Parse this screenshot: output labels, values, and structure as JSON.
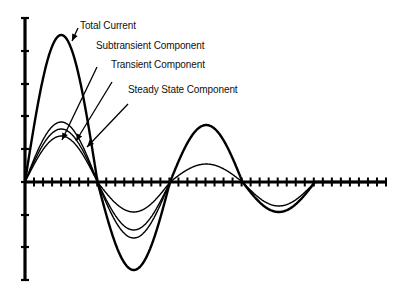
{
  "chart_data": {
    "type": "line",
    "title": "",
    "xlabel": "",
    "ylabel": "",
    "grid": false,
    "legend_position": "annotations with arrows",
    "x_axis": {
      "y_px": 182,
      "x_start_px": 25,
      "x_end_px": 386,
      "tick_count": 40
    },
    "y_axis": {
      "x_px": 25,
      "y_top_px": 18,
      "y_bottom_px": 280,
      "ticks_px": [
        18,
        51,
        84,
        116,
        149,
        182,
        215,
        247,
        280
      ]
    },
    "half_cycle_px": 72.5,
    "series": [
      {
        "name": "Total Current",
        "stroke": 2.4,
        "peaks": [
          147,
          88,
          57,
          30,
          0
        ]
      },
      {
        "name": "Subtransient Component",
        "stroke": 1.4,
        "peaks": [
          60,
          30,
          18,
          24,
          0
        ]
      },
      {
        "name": "Transient Component",
        "stroke": 1.4,
        "peaks": [
          53,
          56,
          0,
          0,
          0
        ]
      },
      {
        "name": "Steady State Component",
        "stroke": 1.4,
        "peaks": [
          46,
          48,
          0,
          0,
          0
        ]
      }
    ]
  },
  "annotations": [
    {
      "text": "Total Current",
      "x": 80,
      "y": 25
    },
    {
      "text": "Subtransient Component",
      "x": 96,
      "y": 45
    },
    {
      "text": "Transient Component",
      "x": 111,
      "y": 63
    },
    {
      "text": "Steady State Component",
      "x": 128,
      "y": 88
    }
  ]
}
